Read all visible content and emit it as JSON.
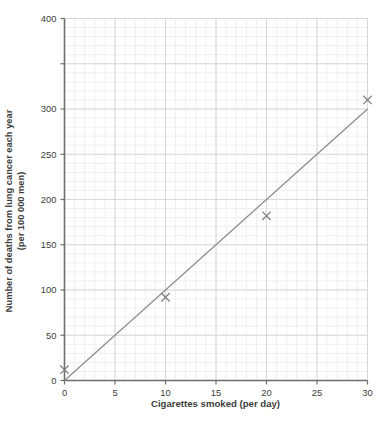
{
  "chart_data": {
    "type": "scatter",
    "title": "",
    "xlabel": "Cigarettes smoked (per day)",
    "ylabel": "Number of deaths from lung cancer each year",
    "ylabel_line2": "(per 100 000 men)",
    "xlim": [
      0,
      30
    ],
    "ylim": [
      0,
      400
    ],
    "xticks": [
      0,
      5,
      10,
      15,
      20,
      25,
      30
    ],
    "xticklabels": [
      "0",
      "5",
      "10",
      "15",
      "20",
      "25",
      "30"
    ],
    "yticks": [
      0,
      50,
      100,
      150,
      200,
      250,
      300,
      350,
      400
    ],
    "yticklabels": [
      "0",
      "50",
      "100",
      "150",
      "200",
      "250",
      "300",
      "",
      "400"
    ],
    "grid": true,
    "minor_grid": true,
    "legend": "none",
    "marker": "x",
    "points": [
      {
        "x": 0,
        "y": 12
      },
      {
        "x": 10,
        "y": 92
      },
      {
        "x": 20,
        "y": 182
      },
      {
        "x": 30,
        "y": 310
      }
    ],
    "series": [
      {
        "name": "Deaths from lung cancer",
        "x": [
          0,
          10,
          20,
          30
        ],
        "values": [
          12,
          92,
          182,
          310
        ]
      }
    ],
    "trend_line": {
      "name": "line of best fit",
      "x0": 0,
      "y0": 0,
      "x1": 30,
      "y1": 300
    },
    "colors": {
      "marker": "#808080",
      "trend_line": "#8c8c8c",
      "axis": "#6e6e6e",
      "major_grid": "#d8d8d8",
      "minor_grid": "#f2eef0",
      "text": "#3c3c3c"
    }
  }
}
